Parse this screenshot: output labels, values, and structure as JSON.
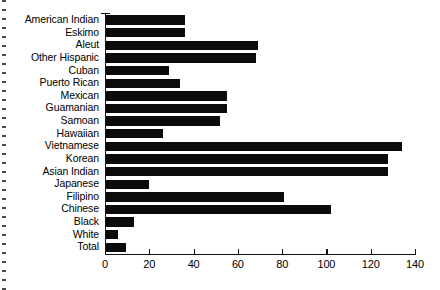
{
  "chart_data": {
    "type": "bar",
    "orientation": "horizontal",
    "title": "",
    "subtitle": "",
    "xlabel": "",
    "ylabel": "",
    "xlim": [
      0,
      140
    ],
    "ylim": null,
    "grid": false,
    "legend": null,
    "legend_position": "none",
    "bar_color": "#0b0b0b",
    "axis_color": "#111111",
    "background_color": "#ffffff",
    "xticks": [
      0,
      20,
      40,
      60,
      80,
      100,
      120,
      140
    ],
    "xtick_labels": [
      "0",
      "20",
      "40",
      "60",
      "80",
      "100",
      "120",
      "140"
    ],
    "categories": [
      "American Indian",
      "Eskimo",
      "Aleut",
      "Other Hispanic",
      "Cuban",
      "Puerto Rican",
      "Mexican",
      "Guamanian",
      "Samoan",
      "Hawaiian",
      "Vietnamese",
      "Korean",
      "Asian Indian",
      "Japanese",
      "Filipino",
      "Chinese",
      "Black",
      "White",
      "Total"
    ],
    "values": [
      36,
      36,
      69,
      68,
      29,
      34,
      55,
      55,
      52,
      26,
      134,
      128,
      128,
      20,
      81,
      102,
      13,
      6,
      9.5
    ],
    "annotations": []
  }
}
